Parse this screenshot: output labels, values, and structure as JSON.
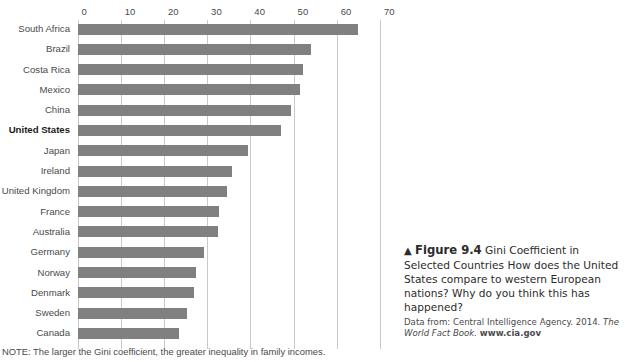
{
  "chart_data": {
    "type": "bar",
    "orientation": "horizontal",
    "title": "Gini Coefficient in Selected Countries",
    "xlabel": "",
    "ylabel": "",
    "xlim": [
      0,
      70
    ],
    "xticks": [
      0,
      10,
      20,
      30,
      40,
      50,
      60,
      70
    ],
    "xtick_labels": [
      "0",
      "10",
      "20",
      "30",
      "40",
      "50",
      "60",
      "70"
    ],
    "grid": "vertical",
    "legend": "none",
    "bar_color": "#808080",
    "highlight_category": "United States",
    "categories": [
      "South Africa",
      "Brazil",
      "Costa Rica",
      "Mexico",
      "China",
      "United States",
      "Japan",
      "Ireland",
      "United Kingdom",
      "France",
      "Australia",
      "Germany",
      "Norway",
      "Denmark",
      "Sweden",
      "Canada"
    ],
    "values": [
      65.0,
      54.0,
      52.3,
      51.4,
      49.4,
      47.1,
      39.4,
      35.7,
      34.5,
      32.8,
      32.5,
      29.3,
      27.5,
      27.0,
      25.3,
      23.5
    ],
    "note": "NOTE: The larger the Gini coefficient, the greater inequality in family incomes."
  },
  "axis": {
    "ticks": [
      {
        "label": "0",
        "value": 0
      },
      {
        "label": "10",
        "value": 10
      },
      {
        "label": "20",
        "value": 20
      },
      {
        "label": "30",
        "value": 30
      },
      {
        "label": "40",
        "value": 40
      },
      {
        "label": "50",
        "value": 50
      },
      {
        "label": "60",
        "value": 60
      },
      {
        "label": "70",
        "value": 70
      }
    ]
  },
  "caption": {
    "arrow": "▲",
    "figure_number": "Figure 9.4",
    "figure_topic": "Gini Coefficient in Selected Countries",
    "question": "How does the United States compare to western European nations? Why do you think this has happened?",
    "source_prefix": "Data from: Central Intelligence Agency. 2014.",
    "source_title": "The World Fact Book.",
    "source_url": "www.cia.gov"
  }
}
